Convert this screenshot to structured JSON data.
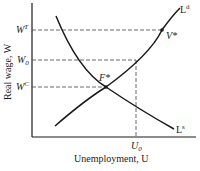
{
  "diagram": {
    "y_axis_label": "Real wage, W",
    "x_axis_label": "Unemployment, U",
    "wage_levels": [
      {
        "label": "W",
        "sup": "T",
        "sub": ""
      },
      {
        "label": "W",
        "sup": "",
        "sub": "0"
      },
      {
        "label": "W",
        "sup": "C",
        "sub": ""
      }
    ],
    "x_marks": [
      {
        "label": "U",
        "sub": "0"
      }
    ],
    "curves": [
      {
        "name": "labor-demand",
        "label": "L",
        "sup": "d"
      },
      {
        "name": "labor-supply",
        "label": "L",
        "sup": "s"
      }
    ],
    "points": [
      {
        "label": "V*"
      },
      {
        "label": "F*"
      }
    ],
    "colors": {
      "line": "#1a1a1a",
      "background": "#ffffff"
    }
  }
}
